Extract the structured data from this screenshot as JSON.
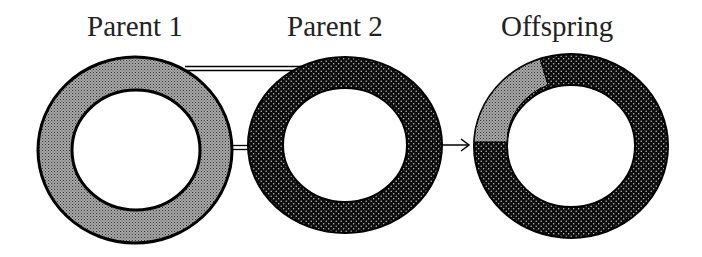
{
  "labels": {
    "parent1": "Parent 1",
    "parent2": "Parent 2",
    "offspring": "Offspring"
  },
  "diagram": {
    "rings": [
      {
        "id": "parent1",
        "pattern": "light-grey-stipple",
        "segments": [
          {
            "from_deg": 0,
            "to_deg": 360,
            "pattern": "light"
          }
        ]
      },
      {
        "id": "parent2",
        "pattern": "dark-dot",
        "segments": [
          {
            "from_deg": 0,
            "to_deg": 360,
            "pattern": "dark"
          }
        ]
      },
      {
        "id": "offspring",
        "pattern": "mixed",
        "segments": [
          {
            "from_deg": 180,
            "to_deg": 250,
            "pattern": "light"
          },
          {
            "from_deg": 250,
            "to_deg": 540,
            "pattern": "dark"
          }
        ]
      }
    ],
    "connectors": [
      "parent1-parent2-top-double-line",
      "parent1-parent2-middle-double-line"
    ],
    "arrow": "parent2-to-offspring"
  },
  "colors": {
    "light_fill": "#8a8a8a",
    "dark_fill": "#111111",
    "outline": "#000000"
  }
}
